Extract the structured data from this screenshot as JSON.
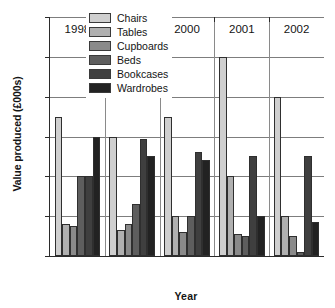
{
  "chart_data": {
    "type": "bar",
    "title": "",
    "xlabel": "Year",
    "ylabel": "Value produced (£000s)",
    "categories": [
      "1998",
      "1999",
      "2000",
      "2001",
      "2002"
    ],
    "ylim": [
      0,
      600
    ],
    "yticks": [
      0,
      100,
      200,
      300,
      400,
      500,
      600
    ],
    "ytick_labels": [
      "0",
      "100",
      "200",
      "300",
      "400",
      "500",
      "600"
    ],
    "grid": true,
    "legend_position": "top-center-inside",
    "series": [
      {
        "name": "Chairs",
        "color": "#cfcfcf",
        "values": [
          350,
          300,
          350,
          500,
          400
        ]
      },
      {
        "name": "Tables",
        "color": "#b0b0b0",
        "values": [
          80,
          65,
          100,
          200,
          100
        ]
      },
      {
        "name": "Cupboards",
        "color": "#8a8a8a",
        "values": [
          75,
          80,
          60,
          55,
          50
        ]
      },
      {
        "name": "Beds",
        "color": "#5e5e5e",
        "values": [
          200,
          130,
          100,
          50,
          10
        ]
      },
      {
        "name": "Bookcases",
        "color": "#3f3f3f",
        "values": [
          200,
          295,
          260,
          250,
          250
        ]
      },
      {
        "name": "Wardrobes",
        "color": "#222222",
        "values": [
          300,
          250,
          240,
          100,
          85
        ]
      }
    ]
  },
  "axis": {
    "y_title": "Value produced (£000s)",
    "x_title": "Year"
  }
}
